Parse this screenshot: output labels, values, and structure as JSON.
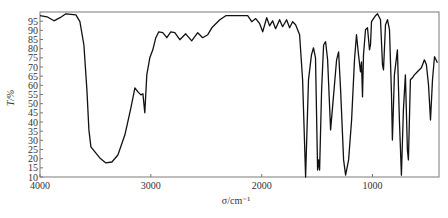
{
  "chart_data": {
    "type": "line",
    "title": "",
    "xlabel": "σ/cm⁻¹",
    "ylabel": "T/%",
    "xlim": [
      4000,
      400
    ],
    "ylim": [
      10,
      100
    ],
    "x_reversed": true,
    "grid": false,
    "legend": null,
    "x_ticks": [
      4000,
      3000,
      2000,
      1000
    ],
    "y_ticks": [
      10,
      15,
      20,
      25,
      30,
      35,
      40,
      45,
      50,
      55,
      60,
      65,
      70,
      75,
      80,
      85,
      90,
      95
    ],
    "series": [
      {
        "name": "IR spectrum",
        "color": "#111111",
        "x": [
          4000,
          3937,
          3874,
          3820,
          3766,
          3676,
          3640,
          3604,
          3577,
          3559,
          3541,
          3505,
          3460,
          3405,
          3351,
          3297,
          3234,
          3180,
          3144,
          3117,
          3090,
          3072,
          3054,
          3036,
          3009,
          2982,
          2955,
          2928,
          2892,
          2856,
          2820,
          2784,
          2739,
          2685,
          2631,
          2577,
          2532,
          2486,
          2450,
          2414,
          2378,
          2324,
          2243,
          2126,
          2090,
          2054,
          2018,
          1991,
          1955,
          1928,
          1901,
          1874,
          1838,
          1811,
          1775,
          1748,
          1721,
          1694,
          1658,
          1631,
          1604,
          1577,
          1550,
          1532,
          1514,
          1495,
          1486,
          1477,
          1459,
          1441,
          1423,
          1405,
          1378,
          1351,
          1324,
          1306,
          1288,
          1261,
          1243,
          1216,
          1189,
          1162,
          1144,
          1126,
          1108,
          1099,
          1090,
          1081,
          1063,
          1045,
          1027,
          1018,
          1009,
          973,
          955,
          928,
          910,
          901,
          883,
          865,
          847,
          829,
          820,
          802,
          775,
          757,
          739,
          721,
          703,
          685,
          676,
          658,
          640,
          622,
          595,
          559,
          532,
          514,
          495,
          477,
          459,
          441,
          423,
          414
        ],
        "y": [
          98,
          97.4,
          95.2,
          96.9,
          99,
          98.5,
          94.7,
          82,
          57.5,
          35.7,
          26.4,
          23.7,
          20.4,
          17.7,
          18.2,
          22,
          33,
          47.7,
          58.6,
          56.4,
          54.8,
          55.4,
          45,
          65.7,
          75,
          79.4,
          86,
          89.2,
          88.7,
          86,
          89.2,
          88.7,
          84.9,
          88.1,
          84.3,
          88.7,
          86,
          87.6,
          91.4,
          93.6,
          95.8,
          98,
          98,
          98,
          94.7,
          96.4,
          93.6,
          89.2,
          96.9,
          92.5,
          95.2,
          90.9,
          95.8,
          92,
          95.8,
          91.4,
          94.7,
          93,
          87.6,
          63,
          10,
          63,
          76.7,
          80.5,
          75,
          13.8,
          19.3,
          13.8,
          57.5,
          82,
          83.8,
          73.9,
          35.7,
          54.8,
          73.9,
          78.3,
          57.5,
          19.3,
          11,
          19.3,
          41.1,
          73.9,
          87.6,
          76.7,
          67.4,
          72.8,
          53.7,
          76.7,
          90.3,
          91.4,
          79.4,
          82.2,
          94.7,
          98,
          99,
          95.8,
          71.2,
          68.5,
          93,
          95.8,
          90.3,
          54.8,
          30.2,
          65.7,
          79.4,
          41.1,
          11,
          46.6,
          65.7,
          24.8,
          19.3,
          63,
          64.1,
          65.7,
          67.4,
          69.6,
          73.9,
          71.2,
          60.3,
          41.1,
          63,
          75.6,
          73.4,
          72.3
        ]
      }
    ]
  },
  "plot_area": {
    "left": 40,
    "top": 12,
    "right": 439,
    "bottom": 177
  },
  "colors": {
    "line": "#111111",
    "axis": "#777777",
    "text": "#333333"
  }
}
